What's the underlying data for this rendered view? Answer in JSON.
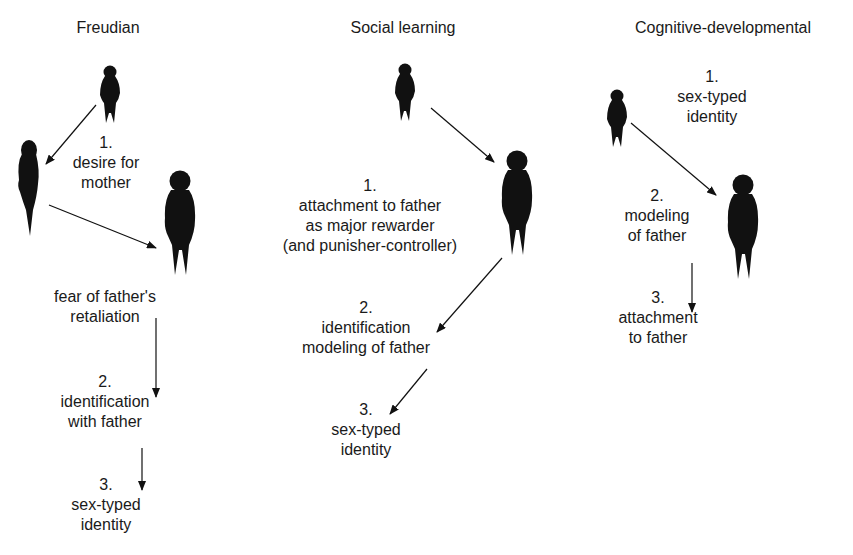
{
  "columns": [
    {
      "title": "Freudian",
      "labels": [
        {
          "lines": [
            "1.",
            "desire for",
            "mother"
          ]
        },
        {
          "lines": [
            "fear of father's",
            "retaliation"
          ]
        },
        {
          "lines": [
            "2.",
            "identification",
            "with father"
          ]
        },
        {
          "lines": [
            "3.",
            "sex-typed",
            "identity"
          ]
        }
      ]
    },
    {
      "title": "Social learning",
      "labels": [
        {
          "lines": [
            "1.",
            "attachment to father",
            "as major rewarder",
            "(and punisher-controller)"
          ]
        },
        {
          "lines": [
            "2.",
            "identification",
            "modeling of father"
          ]
        },
        {
          "lines": [
            "3.",
            "sex-typed",
            "identity"
          ]
        }
      ]
    },
    {
      "title": "Cognitive-developmental",
      "labels": [
        {
          "lines": [
            "1.",
            "sex-typed",
            "identity"
          ]
        },
        {
          "lines": [
            "2.",
            "modeling",
            "of father"
          ]
        },
        {
          "lines": [
            "3.",
            "attachment",
            "to father"
          ]
        }
      ]
    }
  ],
  "icons": [
    "child-figure-icon",
    "mother-figure-icon",
    "father-figure-icon"
  ],
  "colors": {
    "ink": "#111111",
    "text": "#1a1a1a",
    "background": "#ffffff"
  }
}
